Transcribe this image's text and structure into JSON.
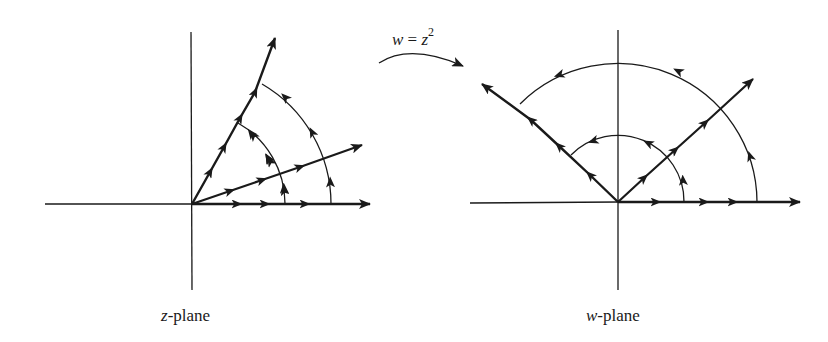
{
  "figure": {
    "mapping": {
      "lhs": "w",
      "equals": " = ",
      "rhs": "z",
      "exponent": "2",
      "arrow_icon": "curved-arrow-right"
    },
    "z_plane": {
      "label_var": "z",
      "label_suffix": "-plane",
      "origin": [
        192,
        204
      ],
      "rays_deg": [
        0,
        22.5,
        60
      ],
      "arc_radii_px": [
        93,
        139
      ],
      "arc_span_deg": [
        0,
        60
      ]
    },
    "w_plane": {
      "label_var": "w",
      "label_suffix": "-plane",
      "origin": [
        618,
        202
      ],
      "rays_deg": [
        0,
        45,
        135
      ],
      "arc_radii_px": [
        66,
        139
      ],
      "arc_span_deg": [
        0,
        135
      ]
    },
    "colors": {
      "ink": "#1a1a1a",
      "background": "#ffffff"
    }
  }
}
